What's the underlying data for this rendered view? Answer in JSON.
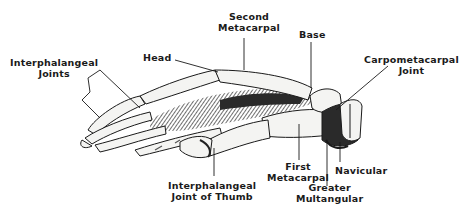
{
  "diagram": {
    "colors": {
      "background": "#ffffff",
      "ink": "#1a1a1a",
      "bone_fill": "#f4f4f2",
      "shadow": "#3a3a3a"
    },
    "labels": {
      "interphalangeal_joints": [
        "Interphalangeal",
        "Joints"
      ],
      "head": "Head",
      "second_metacarpal": [
        "Second",
        "Metacarpal"
      ],
      "base": "Base",
      "carpometacarpal_joint": [
        "Carpometacarpal",
        "Joint"
      ],
      "interphalangeal_joint_of_thumb": [
        "Interphalangeal",
        "Joint of Thumb"
      ],
      "first_metacarpal": [
        "First",
        "Metacarpal"
      ],
      "navicular": "Navicular",
      "greater_multangular": [
        "Greater",
        "Multangular"
      ]
    }
  }
}
